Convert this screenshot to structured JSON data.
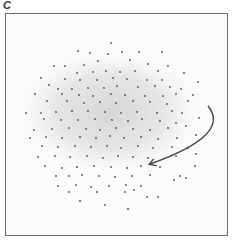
{
  "panel": {
    "label": "C"
  },
  "chart_data": {
    "type": "scatter",
    "title": "",
    "xlabel": "",
    "ylabel": "",
    "grid": false,
    "legend": null,
    "frame": {
      "x": 5,
      "y": 13,
      "width": 223,
      "height": 223
    },
    "cloud": {
      "cx": 110,
      "cy": 112,
      "rx": 92,
      "ry": 62,
      "color": "#d8d8d8"
    },
    "point_color": "#555555",
    "annotations": [
      {
        "type": "curved-arrow",
        "from": [
          208,
          106
        ],
        "control": [
          232,
          135
        ],
        "to": [
          150,
          164
        ],
        "color": "#444444"
      }
    ],
    "points": [
      [
        111,
        43
      ],
      [
        78,
        51
      ],
      [
        90,
        53
      ],
      [
        108,
        54
      ],
      [
        122,
        52
      ],
      [
        139,
        52
      ],
      [
        162,
        52
      ],
      [
        98,
        61
      ],
      [
        130,
        60
      ],
      [
        54,
        66
      ],
      [
        65,
        66
      ],
      [
        84,
        65
      ],
      [
        148,
        64
      ],
      [
        168,
        66
      ],
      [
        77,
        73
      ],
      [
        93,
        72
      ],
      [
        106,
        71
      ],
      [
        120,
        72
      ],
      [
        135,
        71
      ],
      [
        158,
        71
      ],
      [
        184,
        73
      ],
      [
        41,
        78
      ],
      [
        65,
        79
      ],
      [
        80,
        80
      ],
      [
        97,
        80
      ],
      [
        113,
        78
      ],
      [
        127,
        79
      ],
      [
        147,
        80
      ],
      [
        162,
        80
      ],
      [
        198,
        82
      ],
      [
        49,
        85
      ],
      [
        58,
        89
      ],
      [
        72,
        89
      ],
      [
        88,
        88
      ],
      [
        104,
        88
      ],
      [
        117,
        86
      ],
      [
        138,
        87
      ],
      [
        155,
        86
      ],
      [
        170,
        87
      ],
      [
        181,
        89
      ],
      [
        35,
        94
      ],
      [
        62,
        94
      ],
      [
        79,
        95
      ],
      [
        93,
        96
      ],
      [
        111,
        94
      ],
      [
        125,
        95
      ],
      [
        145,
        96
      ],
      [
        163,
        96
      ],
      [
        176,
        94
      ],
      [
        193,
        95
      ],
      [
        47,
        101
      ],
      [
        67,
        101
      ],
      [
        84,
        103
      ],
      [
        100,
        102
      ],
      [
        116,
        103
      ],
      [
        133,
        101
      ],
      [
        150,
        102
      ],
      [
        167,
        104
      ],
      [
        188,
        101
      ],
      [
        26,
        113
      ],
      [
        41,
        113
      ],
      [
        56,
        112
      ],
      [
        72,
        111
      ],
      [
        88,
        111
      ],
      [
        105,
        112
      ],
      [
        121,
        113
      ],
      [
        137,
        112
      ],
      [
        157,
        113
      ],
      [
        172,
        111
      ],
      [
        182,
        113
      ],
      [
        44,
        119
      ],
      [
        61,
        120
      ],
      [
        78,
        120
      ],
      [
        95,
        119
      ],
      [
        112,
        120
      ],
      [
        128,
        121
      ],
      [
        142,
        119
      ],
      [
        160,
        121
      ],
      [
        176,
        123
      ],
      [
        199,
        118
      ],
      [
        34,
        130
      ],
      [
        52,
        129
      ],
      [
        69,
        128
      ],
      [
        86,
        129
      ],
      [
        100,
        130
      ],
      [
        116,
        128
      ],
      [
        133,
        129
      ],
      [
        150,
        130
      ],
      [
        168,
        128
      ],
      [
        186,
        126
      ],
      [
        30,
        138
      ],
      [
        46,
        137
      ],
      [
        62,
        138
      ],
      [
        80,
        137
      ],
      [
        96,
        138
      ],
      [
        110,
        136
      ],
      [
        124,
        138
      ],
      [
        141,
        137
      ],
      [
        158,
        139
      ],
      [
        177,
        138
      ],
      [
        196,
        135
      ],
      [
        42,
        146
      ],
      [
        58,
        147
      ],
      [
        75,
        146
      ],
      [
        91,
        147
      ],
      [
        107,
        146
      ],
      [
        121,
        148
      ],
      [
        138,
        146
      ],
      [
        153,
        148
      ],
      [
        172,
        147
      ],
      [
        188,
        148
      ],
      [
        38,
        157
      ],
      [
        55,
        156
      ],
      [
        70,
        157
      ],
      [
        87,
        156
      ],
      [
        103,
        158
      ],
      [
        118,
        156
      ],
      [
        133,
        157
      ],
      [
        148,
        158
      ],
      [
        176,
        156
      ],
      [
        196,
        154
      ],
      [
        45,
        166
      ],
      [
        62,
        168
      ],
      [
        77,
        167
      ],
      [
        94,
        166
      ],
      [
        111,
        167
      ],
      [
        127,
        168
      ],
      [
        141,
        166
      ],
      [
        160,
        167
      ],
      [
        195,
        166
      ],
      [
        56,
        176
      ],
      [
        69,
        176
      ],
      [
        82,
        175
      ],
      [
        99,
        176
      ],
      [
        115,
        177
      ],
      [
        132,
        176
      ],
      [
        150,
        175
      ],
      [
        180,
        176
      ],
      [
        58,
        186
      ],
      [
        76,
        185
      ],
      [
        91,
        187
      ],
      [
        109,
        186
      ],
      [
        126,
        185
      ],
      [
        141,
        186
      ],
      [
        174,
        180
      ],
      [
        186,
        178
      ],
      [
        69,
        192
      ],
      [
        97,
        192
      ],
      [
        125,
        192
      ],
      [
        134,
        190
      ],
      [
        147,
        197
      ],
      [
        158,
        197
      ],
      [
        80,
        201
      ],
      [
        105,
        205
      ],
      [
        128,
        209
      ]
    ]
  }
}
